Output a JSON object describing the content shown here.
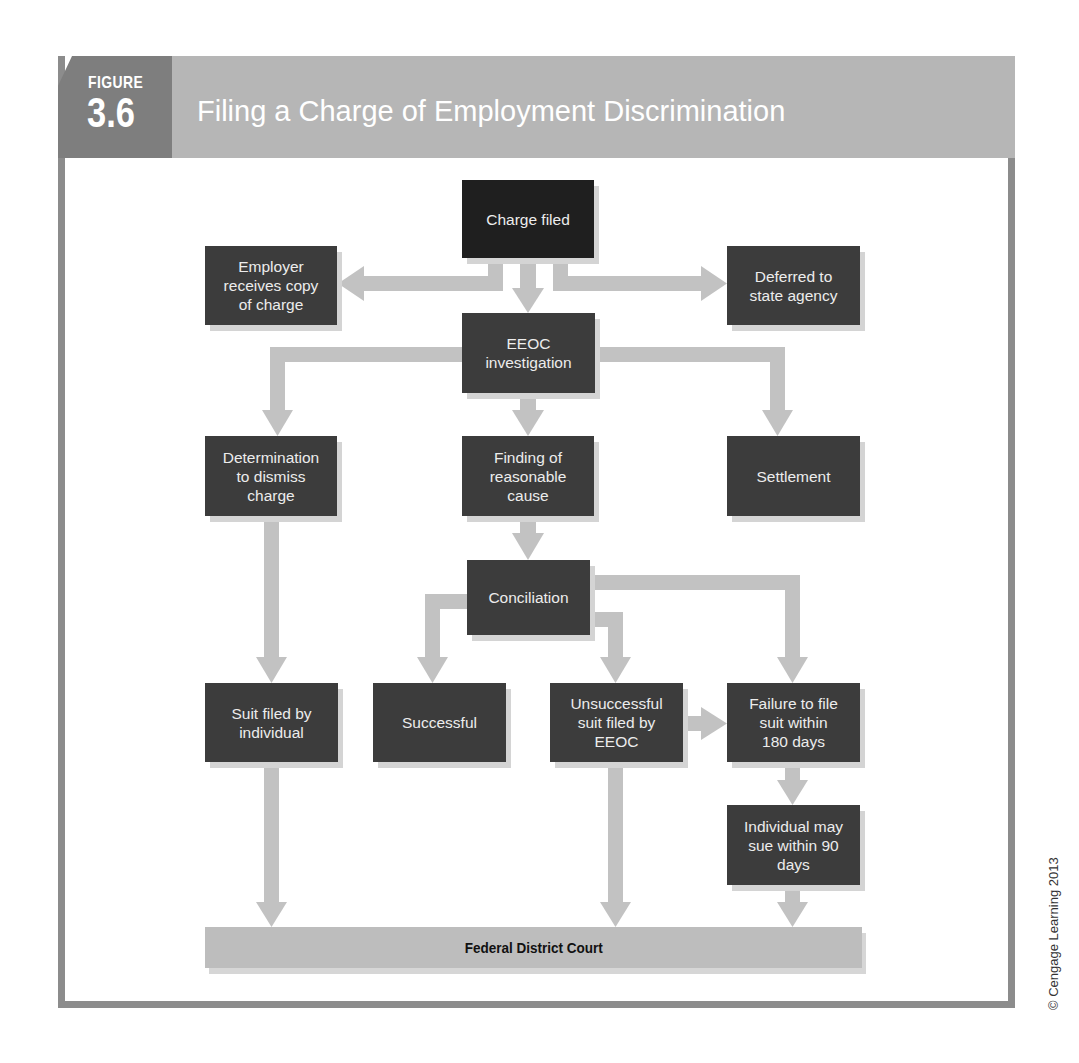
{
  "header": {
    "figure_label": "FIGURE",
    "figure_number": "3.6",
    "title": "Filing a Charge of Employment Discrimination"
  },
  "colors": {
    "box": "#3c3c3c",
    "start_box": "#1f1f1f",
    "arrow": "#c2c2c2",
    "court": "#bdbdbd",
    "frame": "#8c8c8c",
    "tab": "#7e7e7e",
    "band": "#b6b6b6"
  },
  "nodes": {
    "charge_filed": "Charge filed",
    "employer_copy": "Employer\nreceives copy\nof charge",
    "deferred_state": "Deferred to\nstate agency",
    "eeoc_investigation": "EEOC\ninvestigation",
    "determination_dismiss": "Determination\nto dismiss\ncharge",
    "reasonable_cause": "Finding of\nreasonable\ncause",
    "settlement": "Settlement",
    "conciliation": "Conciliation",
    "suit_individual": "Suit filed by\nindividual",
    "successful": "Successful",
    "unsuccessful": "Unsuccessful\nsuit filed by\nEEOC",
    "failure_180": "Failure to file\nsuit within\n180 days",
    "individual_90": "Individual may\nsue within 90\ndays",
    "federal_court": "Federal District Court"
  },
  "edges": [
    [
      "charge_filed",
      "employer_copy"
    ],
    [
      "charge_filed",
      "eeoc_investigation"
    ],
    [
      "charge_filed",
      "deferred_state"
    ],
    [
      "eeoc_investigation",
      "determination_dismiss"
    ],
    [
      "eeoc_investigation",
      "reasonable_cause"
    ],
    [
      "eeoc_investigation",
      "settlement"
    ],
    [
      "reasonable_cause",
      "conciliation"
    ],
    [
      "determination_dismiss",
      "suit_individual"
    ],
    [
      "conciliation",
      "successful"
    ],
    [
      "conciliation",
      "unsuccessful"
    ],
    [
      "conciliation",
      "failure_180"
    ],
    [
      "unsuccessful",
      "failure_180"
    ],
    [
      "failure_180",
      "individual_90"
    ],
    [
      "suit_individual",
      "federal_court"
    ],
    [
      "unsuccessful",
      "federal_court"
    ],
    [
      "individual_90",
      "federal_court"
    ]
  ],
  "credit": "© Cengage Learning 2013"
}
